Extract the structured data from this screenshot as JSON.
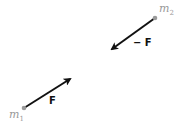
{
  "diagram": {
    "masses": [
      {
        "id": "m1",
        "label_base": "m",
        "label_sub": "1",
        "x": 24,
        "y": 108
      },
      {
        "id": "m2",
        "label_base": "m",
        "label_sub": "2",
        "x": 155,
        "y": 18
      }
    ],
    "forces": [
      {
        "on": "m1",
        "label": "F",
        "from": [
          24,
          108
        ],
        "to": [
          71,
          78
        ]
      },
      {
        "on": "m2",
        "label": "− F",
        "from": [
          155,
          18
        ],
        "to": [
          111,
          50
        ]
      }
    ],
    "colors": {
      "arrow": "#111111",
      "dot": "#9a9a9a",
      "mass_label": "#999999"
    }
  }
}
